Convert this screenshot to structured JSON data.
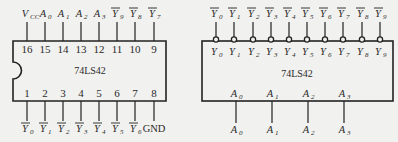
{
  "colors": {
    "background": "#f1f1ef",
    "line": "#222222",
    "text": "#2a2a2a"
  },
  "left_chip": {
    "name": "74LS42",
    "top_pins": [
      {
        "num": "16",
        "label": "V",
        "sub": "CC",
        "bar": false,
        "x": 27
      },
      {
        "num": "15",
        "label": "A",
        "sub": "0",
        "bar": false,
        "x": 45
      },
      {
        "num": "14",
        "label": "A",
        "sub": "1",
        "bar": false,
        "x": 63
      },
      {
        "num": "13",
        "label": "A",
        "sub": "2",
        "bar": false,
        "x": 81
      },
      {
        "num": "12",
        "label": "A",
        "sub": "3",
        "bar": false,
        "x": 99
      },
      {
        "num": "11",
        "label": "Y",
        "sub": "9",
        "bar": true,
        "x": 117
      },
      {
        "num": "10",
        "label": "Y",
        "sub": "8",
        "bar": true,
        "x": 135
      },
      {
        "num": "9",
        "label": "Y",
        "sub": "7",
        "bar": true,
        "x": 154
      }
    ],
    "bottom_pins": [
      {
        "num": "1",
        "label": "Y",
        "sub": "0",
        "bar": true,
        "x": 27
      },
      {
        "num": "2",
        "label": "Y",
        "sub": "1",
        "bar": true,
        "x": 45
      },
      {
        "num": "3",
        "label": "Y",
        "sub": "2",
        "bar": true,
        "x": 63
      },
      {
        "num": "4",
        "label": "Y",
        "sub": "3",
        "bar": true,
        "x": 81
      },
      {
        "num": "5",
        "label": "Y",
        "sub": "4",
        "bar": true,
        "x": 99
      },
      {
        "num": "6",
        "label": "Y",
        "sub": "5",
        "bar": true,
        "x": 117
      },
      {
        "num": "7",
        "label": "Y",
        "sub": "6",
        "bar": true,
        "x": 135
      },
      {
        "num": "8",
        "label": "GND",
        "sub": "",
        "bar": false,
        "x": 154
      }
    ]
  },
  "right_chip": {
    "name": "74LS42",
    "outputs": [
      {
        "label": "Y",
        "sub": "0",
        "x": 216
      },
      {
        "label": "Y",
        "sub": "1",
        "x": 234
      },
      {
        "label": "Y",
        "sub": "2",
        "x": 253
      },
      {
        "label": "Y",
        "sub": "3",
        "x": 271
      },
      {
        "label": "Y",
        "sub": "4",
        "x": 289
      },
      {
        "label": "Y",
        "sub": "5",
        "x": 307
      },
      {
        "label": "Y",
        "sub": "6",
        "x": 325
      },
      {
        "label": "Y",
        "sub": "7",
        "x": 343
      },
      {
        "label": "Y",
        "sub": "8",
        "x": 362
      },
      {
        "label": "Y",
        "sub": "9",
        "x": 380
      }
    ],
    "inputs": [
      {
        "label": "A",
        "sub": "0",
        "x": 236
      },
      {
        "label": "A",
        "sub": "1",
        "x": 272
      },
      {
        "label": "A",
        "sub": "2",
        "x": 308
      },
      {
        "label": "A",
        "sub": "3",
        "x": 344
      }
    ]
  }
}
